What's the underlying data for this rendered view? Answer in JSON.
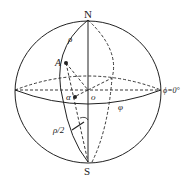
{
  "diagram": {
    "type": "sphere-coordinate-diagram",
    "labels": {
      "north": "N",
      "south": "S",
      "center": "o",
      "point_a": "A",
      "rho": "ρ",
      "rho_half": "ρ/2",
      "alpha": "α",
      "phi": "φ",
      "meridian_zero": "ϕ=0°"
    },
    "colors": {
      "line": "#222222",
      "background": "#ffffff"
    }
  }
}
